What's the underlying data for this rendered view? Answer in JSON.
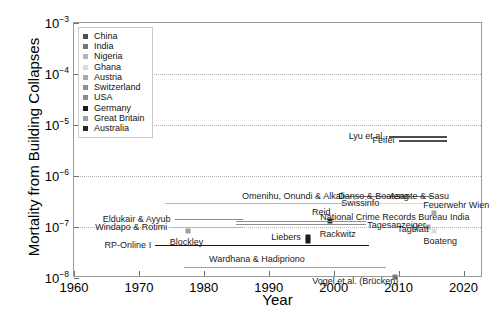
{
  "chart_data": {
    "type": "scatter",
    "title": "",
    "xlabel": "Year",
    "ylabel": "Mortality from Building Collapses",
    "xlim": [
      1960,
      2023
    ],
    "ylim_exponents": [
      -8,
      -3
    ],
    "yscale": "log",
    "grid": "horizontal dotted gridlines at each decade",
    "legend_position": "top-left inside axes",
    "xticks": [
      "1960",
      "1970",
      "1980",
      "1990",
      "2000",
      "2010",
      "2020"
    ],
    "xtick_values": [
      1960,
      1970,
      1980,
      1990,
      2000,
      2010,
      2020
    ],
    "ytick_labels": [
      "10-3",
      "10-4",
      "10-5",
      "10-6",
      "10-7",
      "10-8"
    ],
    "ytick_exponents": [
      -3,
      -4,
      -5,
      -6,
      -7,
      -8
    ],
    "legend": [
      {
        "label": "China",
        "color": "#4d4d4d"
      },
      {
        "label": "India",
        "color": "#757575"
      },
      {
        "label": "Nigeria",
        "color": "#b5b5b5"
      },
      {
        "label": "Ghana",
        "color": "#dcdcdc"
      },
      {
        "label": "Austria",
        "color": "#a8a8a8"
      },
      {
        "label": "Switzerland",
        "color": "#8f8f8f"
      },
      {
        "label": "USA",
        "color": "#8a8a8a"
      },
      {
        "label": "Germany",
        "color": "#1a1a1a"
      },
      {
        "label": "Great Britain",
        "color": "#9e9e9e"
      },
      {
        "label": "Australia",
        "color": "#262626"
      }
    ],
    "series": [
      {
        "name": "Lyu et al.",
        "country": "China",
        "kind": "span",
        "x_start": 2008.5,
        "x_end": 2017.5,
        "y": 6e-06,
        "color": "#4d4d4d",
        "label_side": "right"
      },
      {
        "name": "Feifei",
        "country": "China",
        "kind": "span",
        "x_start": 2010.0,
        "x_end": 2017.5,
        "y": 5e-06,
        "color": "#4d4d4d",
        "label_side": "right"
      },
      {
        "name": "National Crime Records Bureau India",
        "country": "India",
        "kind": "span",
        "x_start": 2001.5,
        "x_end": 2015.5,
        "y": 4.1e-07,
        "color": "#757575",
        "label_side": "below-center"
      },
      {
        "name": "Omenihu, Onundi & Alkali",
        "country": "Nigeria",
        "kind": "span",
        "x_start": 1974.0,
        "x_end": 2010.5,
        "y": 2.9e-07,
        "color": "#b5b5b5",
        "label_side": "above-center"
      },
      {
        "name": "Danso & Boateng",
        "country": "Ghana",
        "kind": "span",
        "x_start": 2001.5,
        "x_end": 2012.0,
        "y": 2.9e-07,
        "color": "#dcdcdc",
        "label_side": "above-center"
      },
      {
        "name": "Asante & Sasu",
        "country": "Ghana",
        "kind": "span",
        "x_start": 2008.0,
        "x_end": 2016.5,
        "y": 2.9e-07,
        "color": "#dcdcdc",
        "label_side": "above-center"
      },
      {
        "name": "Feuerwehr Wien",
        "country": "Austria",
        "kind": "point",
        "x": 2015.5,
        "y": 1.85e-07,
        "color": "#a8a8a8",
        "label_side": "above-center"
      },
      {
        "name": "Eldukair & Ayyub",
        "country": "USA",
        "kind": "span",
        "x_start": 1975.5,
        "x_end": 1986.0,
        "y": 1.45e-07,
        "color": "#8a8a8a",
        "label_side": "left"
      },
      {
        "name": "Reid",
        "country": "Australia",
        "kind": "point",
        "x": 1999.5,
        "y": 1.3e-07,
        "color": "#262626",
        "label_side": "above-left"
      },
      {
        "name": "Swissinfo",
        "country": "Switzerland",
        "kind": "span",
        "x_start": 1985.0,
        "x_end": 2005.0,
        "y": 1.3e-07,
        "color": "#8f8f8f",
        "label_side": "above-right"
      },
      {
        "name": "Tagesanzeiger",
        "country": "Switzerland",
        "kind": "span",
        "x_start": 1985.0,
        "x_end": 2005.0,
        "y": 1.15e-07,
        "color": "#8f8f8f",
        "label_side": "right-of-line"
      },
      {
        "name": "Windapo & Rotimi",
        "country": "Nigeria",
        "kind": "span",
        "x_start": 1975.0,
        "x_end": 1986.0,
        "y": 1e-07,
        "color": "#b5b5b5",
        "label_side": "left"
      },
      {
        "name": "Tagblatt",
        "country": "Austria",
        "kind": "point",
        "x": 2014.5,
        "y": 1e-07,
        "color": "#a8a8a8",
        "label_side": "right"
      },
      {
        "name": "Boateng",
        "country": "Ghana",
        "kind": "point",
        "x": 2015.5,
        "y": 8.2e-08,
        "color": "#dcdcdc",
        "label_side": "below-center"
      },
      {
        "name": "Blockley",
        "country": "Great Britain",
        "kind": "point",
        "x": 1977.5,
        "y": 8.5e-08,
        "color": "#9e9e9e",
        "label_side": "below-center"
      },
      {
        "name": "Liebers",
        "country": "Germany",
        "kind": "point",
        "x": 1996.0,
        "y": 6.3e-08,
        "color": "#1a1a1a",
        "label_side": "left-of-point"
      },
      {
        "name": "Rackwitz",
        "country": "Germany",
        "kind": "point",
        "x": 1996.0,
        "y": 5.2e-08,
        "color": "#1a1a1a",
        "label_side": "above-right"
      },
      {
        "name": "RP-Online I",
        "country": "Germany",
        "kind": "span",
        "x_start": 1972.5,
        "x_end": 2005.5,
        "y": 4.5e-08,
        "color": "#1a1a1a",
        "label_side": "left"
      },
      {
        "name": "Wardhana & Hadipriono",
        "country": "USA",
        "kind": "span",
        "x_start": 1977.0,
        "x_end": 2008.0,
        "y": 1.65e-08,
        "color": "#a5a5a5",
        "label_side": "above-center"
      },
      {
        "name": "Vogel et al. (Brücken)",
        "country": "Germany",
        "kind": "point",
        "x": 2009.5,
        "y": 1.05e-08,
        "color": "#7a7a7a",
        "label_side": "right"
      }
    ]
  }
}
